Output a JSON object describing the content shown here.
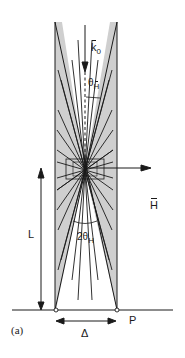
{
  "figure": {
    "panel_label": "(a)",
    "labels": {
      "incident_wavevector": "k",
      "incident_wavevector_sub": "0",
      "bragg_angle_symbol": "θ",
      "bragg_angle_sub": "H",
      "reciprocal_vector": "H",
      "thickness": "L",
      "double_angle_prefix": "2θ",
      "double_angle_sub": "H",
      "base_width": "Δ",
      "point": "P"
    },
    "colors": {
      "line": "#1a1a1a",
      "fill": "#cfcfcf",
      "background": "#ffffff"
    }
  }
}
